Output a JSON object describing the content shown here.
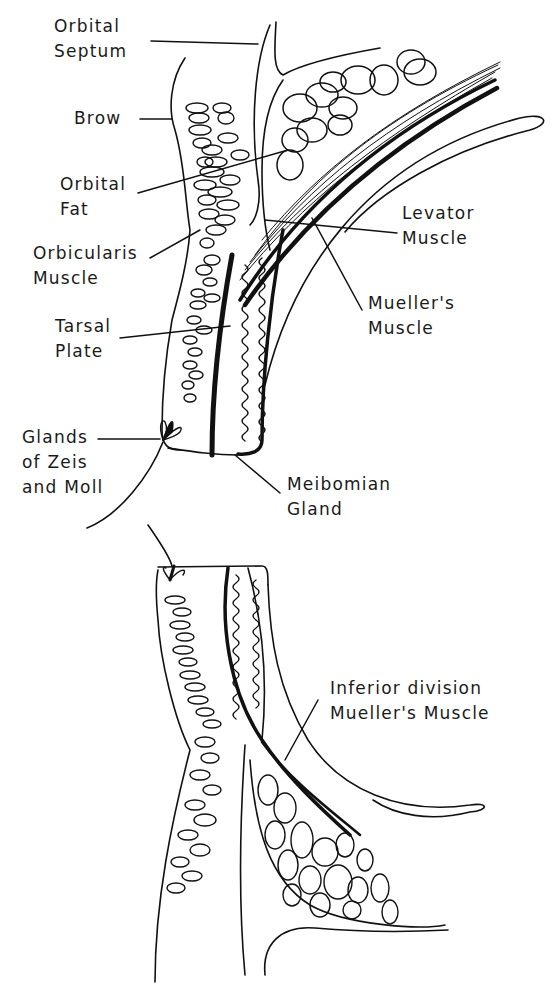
{
  "diagram": {
    "upper_lid": {
      "labels": [
        {
          "id": "orbital-septum",
          "text": "Orbital\nSeptum",
          "x": 54,
          "y": 14
        },
        {
          "id": "brow",
          "text": "Brow",
          "x": 74,
          "y": 104
        },
        {
          "id": "orbital-fat",
          "text": "Orbital\nFat",
          "x": 60,
          "y": 172
        },
        {
          "id": "orbicularis-muscle",
          "text": "Orbicularis\nMuscle",
          "x": 33,
          "y": 241
        },
        {
          "id": "tarsal-plate",
          "text": "Tarsal\nPlate",
          "x": 55,
          "y": 314
        },
        {
          "id": "levator-muscle",
          "text": "Levator\nMuscle",
          "x": 402,
          "y": 201
        },
        {
          "id": "muellers-muscle",
          "text": "Mueller's\nMuscle",
          "x": 368,
          "y": 291
        },
        {
          "id": "glands-zeis-moll",
          "text": "Glands\nof Zeis\nand Moll",
          "x": 22,
          "y": 425
        },
        {
          "id": "meibomian-gland",
          "text": "Meibomian\nGland",
          "x": 287,
          "y": 472
        }
      ]
    },
    "lower_lid": {
      "labels": [
        {
          "id": "inferior-division-muellers",
          "text": "Inferior division\nMueller's Muscle",
          "x": 330,
          "y": 676
        }
      ]
    },
    "colors": {
      "ink": "#111111",
      "background": "#ffffff"
    }
  }
}
